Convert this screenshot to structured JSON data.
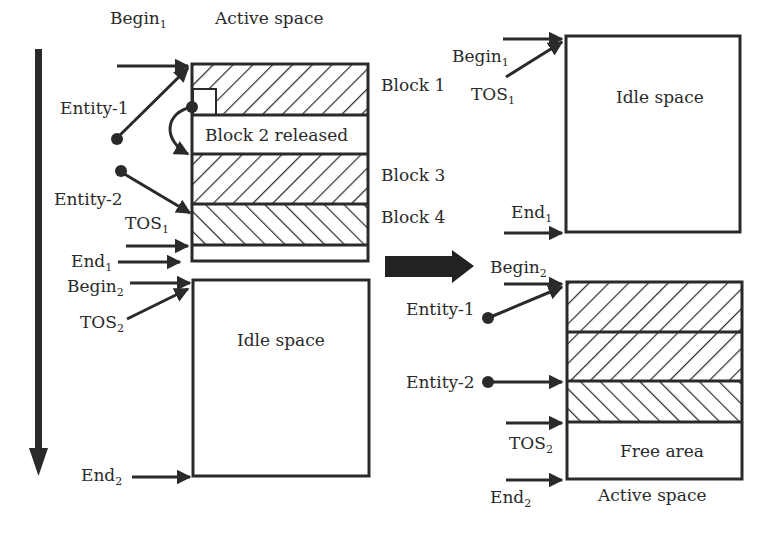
{
  "diagram": {
    "colors": {
      "line": "#2a2a2a",
      "fill": "#ffffff",
      "arrow": "#222222"
    },
    "left": {
      "begin1": "Begin",
      "begin1_sub": "1",
      "active_space": "Active space",
      "entity1": "Entity-1",
      "entity2": "Entity-2",
      "tos1": "TOS",
      "tos1_sub": "1",
      "end1": "End",
      "end1_sub": "1",
      "begin2": "Begin",
      "begin2_sub": "2",
      "tos2": "TOS",
      "tos2_sub": "2",
      "idle_space": "Idle space",
      "end2": "End",
      "end2_sub": "2",
      "blocks": [
        {
          "label": "Block 1",
          "pattern": "hatch-forward"
        },
        {
          "label": "Block 2 released",
          "pattern": "empty"
        },
        {
          "label": "Block 3",
          "pattern": "hatch-forward"
        },
        {
          "label": "Block 4",
          "pattern": "hatch-backward"
        }
      ]
    },
    "transition_arrow": "right-arrow",
    "right": {
      "begin1": "Begin",
      "begin1_sub": "1",
      "tos1": "TOS",
      "tos1_sub": "1",
      "idle_space": "Idle space",
      "end1": "End",
      "end1_sub": "1",
      "begin2": "Begin",
      "begin2_sub": "2",
      "entity1": "Entity-1",
      "entity2": "Entity-2",
      "tos2": "TOS",
      "tos2_sub": "2",
      "free_area": "Free area",
      "end2": "End",
      "end2_sub": "2",
      "active_space": "Active space"
    }
  }
}
